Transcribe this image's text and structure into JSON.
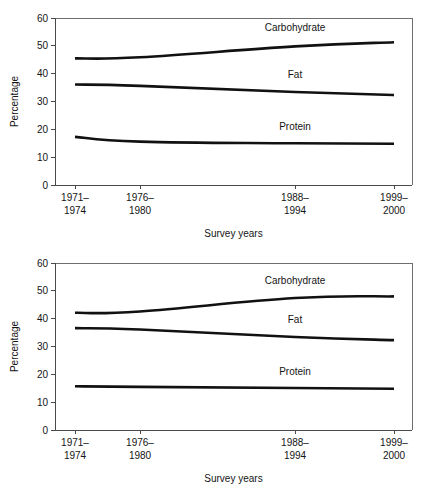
{
  "chart_data": [
    {
      "id": "top",
      "type": "line",
      "title": "",
      "xlabel": "Survey years",
      "ylabel": "Percentage",
      "ylim": [
        0,
        60
      ],
      "yticks": [
        0,
        10,
        20,
        30,
        40,
        50,
        60
      ],
      "ytick_labels": [
        "0",
        "10",
        "20",
        "30",
        "40",
        "50",
        "60"
      ],
      "grid": false,
      "legend_position": "inline-above-line",
      "categories": [
        "1971–1974",
        "1976–1980",
        "1988–1994",
        "1999–2000"
      ],
      "xtick_labels_line1": [
        "1971–",
        "1976–",
        "1988–",
        "1999–"
      ],
      "xtick_labels_line2": [
        "1974",
        "1980",
        "1994",
        "2000"
      ],
      "series": [
        {
          "name": "Carbohydrate",
          "values": [
            45.5,
            45.9,
            49.8,
            51.3
          ],
          "label_x_category_index": 2,
          "label_offset": 5.5
        },
        {
          "name": "Fat",
          "values": [
            36.1,
            35.6,
            33.4,
            32.3
          ],
          "label_x_category_index": 2,
          "label_offset": 5.0
        },
        {
          "name": "Protein",
          "values": [
            17.3,
            15.6,
            15.0,
            14.8
          ],
          "label_x_category_index": 2,
          "label_offset": 4.8
        }
      ]
    },
    {
      "id": "bottom",
      "type": "line",
      "title": "",
      "xlabel": "Survey years",
      "ylabel": "Percentage",
      "ylim": [
        0,
        60
      ],
      "yticks": [
        0,
        10,
        20,
        30,
        40,
        50,
        60
      ],
      "ytick_labels": [
        "0",
        "10",
        "20",
        "30",
        "40",
        "50",
        "60"
      ],
      "grid": false,
      "legend_position": "inline-above-line",
      "categories": [
        "1971–1974",
        "1976–1980",
        "1988–1994",
        "1999–2000"
      ],
      "xtick_labels_line1": [
        "1971–",
        "1976–",
        "1988–",
        "1999–"
      ],
      "xtick_labels_line2": [
        "1974",
        "1980",
        "1994",
        "2000"
      ],
      "series": [
        {
          "name": "Carbohydrate",
          "values": [
            42.1,
            42.6,
            47.4,
            48.0
          ],
          "label_x_category_index": 2,
          "label_offset": 5.2
        },
        {
          "name": "Fat",
          "values": [
            36.6,
            36.1,
            33.4,
            32.3
          ],
          "label_x_category_index": 2,
          "label_offset": 5.0
        },
        {
          "name": "Protein",
          "values": [
            15.7,
            15.5,
            15.1,
            14.8
          ],
          "label_x_category_index": 2,
          "label_offset": 4.8
        }
      ]
    }
  ]
}
